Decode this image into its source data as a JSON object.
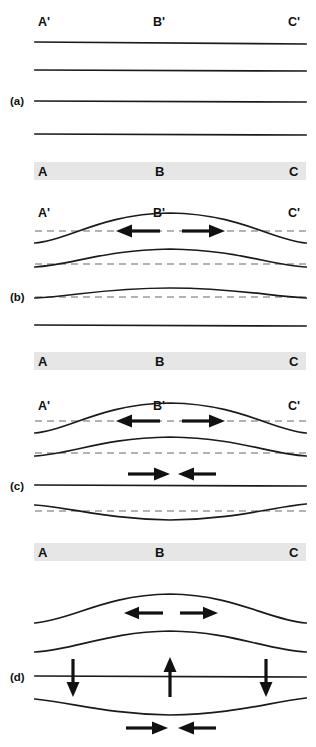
{
  "figure": {
    "width": 316,
    "height": 747,
    "background_color": "#ffffff",
    "line_color": "#1a1a1a",
    "dashed_color": "#9a9a9a",
    "band_color": "#e6e6e6",
    "arrow_color": "#111111"
  },
  "panels": [
    {
      "id": "a",
      "label": "(a)",
      "top_labels": {
        "left": "A'",
        "center": "B'",
        "right": "C'"
      },
      "band_labels": {
        "left": "A",
        "center": "B",
        "right": "C"
      },
      "state": "undeformed flat layers",
      "layer_count": 4,
      "arrows": []
    },
    {
      "id": "b",
      "label": "(b)",
      "top_labels": {
        "left": "A'",
        "center": "B'",
        "right": "C'"
      },
      "band_labels": {
        "left": "A",
        "center": "B",
        "right": "C"
      },
      "state": "upward arching of upper layers",
      "layer_count": 4,
      "arrows": [
        {
          "name": "extension-left",
          "direction": "left",
          "row": "top-curve"
        },
        {
          "name": "extension-right",
          "direction": "right",
          "row": "top-curve"
        }
      ]
    },
    {
      "id": "c",
      "label": "(c)",
      "top_labels": {
        "left": "A'",
        "center": "B'",
        "right": "C'"
      },
      "band_labels": {
        "left": "A",
        "center": "B",
        "right": "C"
      },
      "state": "arching above, compression and sagging below",
      "layer_count": 4,
      "arrows": [
        {
          "name": "extension-left",
          "direction": "left",
          "row": "top-curve"
        },
        {
          "name": "extension-right",
          "direction": "right",
          "row": "top-curve"
        },
        {
          "name": "compression-right",
          "direction": "right",
          "row": "mid-line"
        },
        {
          "name": "compression-left",
          "direction": "left",
          "row": "mid-line"
        }
      ]
    },
    {
      "id": "d",
      "label": "(d)",
      "top_labels": null,
      "band_labels": {
        "left": "A",
        "center": "B",
        "right": "C"
      },
      "state": "full fold with vertical displacement and basal compression",
      "layer_count": 4,
      "arrows": [
        {
          "name": "extension-left",
          "direction": "left",
          "row": "top-curve"
        },
        {
          "name": "extension-right",
          "direction": "right",
          "row": "top-curve"
        },
        {
          "name": "subsidence-left",
          "direction": "down",
          "row": "mid-line"
        },
        {
          "name": "uplift-center",
          "direction": "up",
          "row": "mid-line"
        },
        {
          "name": "subsidence-right",
          "direction": "down",
          "row": "mid-line"
        },
        {
          "name": "compression-right",
          "direction": "right",
          "row": "bottom-curve"
        },
        {
          "name": "compression-left",
          "direction": "left",
          "row": "bottom-curve"
        }
      ]
    }
  ],
  "geometry": {
    "x_left": 35,
    "x_right": 306,
    "x_center": 170,
    "label_x_left": 38,
    "label_x_center": 153,
    "label_x_right": 288,
    "panel_label_x": 10,
    "bands": [
      {
        "panel": "a",
        "y": 162,
        "height": 18
      },
      {
        "panel": "b",
        "y": 352,
        "height": 18
      },
      {
        "panel": "c",
        "y": 543,
        "height": 18
      }
    ]
  }
}
